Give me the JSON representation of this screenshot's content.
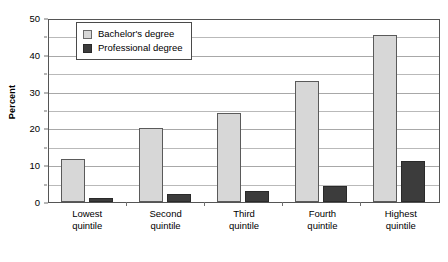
{
  "chart_data": {
    "type": "bar",
    "title": "",
    "subtitle": "",
    "xlabel": "",
    "ylabel": "Percent",
    "ylim": [
      0,
      50
    ],
    "yticks": [
      0,
      10,
      20,
      30,
      40,
      50
    ],
    "ytick_labels": [
      "0",
      "10",
      "20",
      "30",
      "40",
      "50"
    ],
    "minor_gridlines": [
      5,
      15,
      25,
      35,
      45
    ],
    "grid": true,
    "legend_position": "upper left inside",
    "categories": [
      "Lowest quintile",
      "Second quintile",
      "Third quintile",
      "Fourth quintile",
      "Highest quintile"
    ],
    "category_lines": [
      [
        "Lowest",
        "quintile"
      ],
      [
        "Second",
        "quintile"
      ],
      [
        "Third",
        "quintile"
      ],
      [
        "Fourth",
        "quintile"
      ],
      [
        "Highest",
        "quintile"
      ]
    ],
    "series": [
      {
        "name": "Bachelor's degree",
        "color": "#d7d7d7",
        "values": [
          11.7,
          20.0,
          24.3,
          32.8,
          45.4
        ]
      },
      {
        "name": "Professional degree",
        "color": "#3c3c3c",
        "values": [
          1.0,
          2.2,
          3.0,
          4.4,
          11.2
        ]
      }
    ]
  },
  "legend": {
    "items": [
      {
        "label": "Bachelor's degree"
      },
      {
        "label": "Professional degree"
      }
    ]
  },
  "axis": {
    "y_title": "Percent"
  }
}
